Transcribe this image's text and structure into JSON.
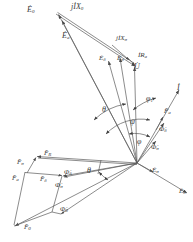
{
  "figure": {
    "type": "phasor-vector-diagram",
    "title": "",
    "stroke_color": "#555555",
    "label_color": "#3a3a3a",
    "background": "#ffffff",
    "width": 193,
    "height": 242
  },
  "origin": {
    "x": 137,
    "y": 163
  },
  "labels": {
    "e0": "Ė",
    "e0_sub": "0",
    "jix0": "jİX",
    "jix0_sub": "0",
    "ea": "Ė",
    "ea_sub": "a",
    "jixs": "jİX",
    "jixs_sub": "σ",
    "edelta": "Ė",
    "edelta_sub": "δ",
    "esigma": "Ė",
    "esigma_sub": "σ",
    "ira": "İR",
    "ira_sub": "a",
    "u": "U̇",
    "u_sub": "",
    "i": "İ",
    "i_sub": "",
    "fa_r": "F̄",
    "fa_r_sub": "a",
    "phi_d": "Φ̇",
    "phi_d_sub": "δ",
    "phi_s": "Φ̇",
    "phi_s_sub": "σ",
    "es_low": "Ė",
    "es_low_sub": "σ",
    "ed_low": "Ė",
    "ed_low_sub": "δ",
    "f_sigma": "F̄",
    "f_sigma_sub": "σ",
    "f_r": "F̄",
    "f_r_sub": "R",
    "f_a": "F̄",
    "f_a_sub": "a",
    "f_delta": "F̄",
    "f_delta_sub": "δ",
    "f_0": "F̄",
    "f_0_sub": "0",
    "phi_d2": "Φ̇",
    "phi_d2_sub": "δ",
    "phi_s2": "Φ̇",
    "phi_s2_sub": "σ",
    "phi_0": "Φ̇",
    "phi_0_sub": "0",
    "ang_theta": "θ",
    "ang_theta2": "θ",
    "ang_phi1": "φ",
    "ang_phi1_sub": "1",
    "ang_psi": "ψ",
    "ang_phi": "φ"
  },
  "vectors": [
    {
      "name": "E0",
      "from": [
        137,
        163
      ],
      "to": [
        57,
        13
      ],
      "label": "Ė0"
    },
    {
      "name": "jIX0",
      "from": [
        57,
        13
      ],
      "to": [
        137,
        163
      ],
      "label": "jİX0"
    },
    {
      "name": "Ea",
      "from": [
        137,
        163
      ],
      "to": [
        62,
        20
      ],
      "label": "Ėa"
    },
    {
      "name": "jIXsigma",
      "from": [
        118,
        50
      ],
      "to": [
        131,
        65
      ],
      "label": "jİXσ"
    },
    {
      "name": "Edelta",
      "from": [
        137,
        163
      ],
      "to": [
        108,
        60
      ],
      "label": "Ėδ"
    },
    {
      "name": "Esigma",
      "from": [
        137,
        163
      ],
      "to": [
        119,
        57
      ],
      "label": "Ėσ"
    },
    {
      "name": "IRa",
      "from": [
        128,
        62
      ],
      "to": [
        137,
        68
      ],
      "label": "İRa"
    },
    {
      "name": "U",
      "from": [
        137,
        163
      ],
      "to": [
        134,
        66
      ],
      "label": "U̇"
    },
    {
      "name": "I",
      "from": [
        137,
        163
      ],
      "to": [
        178,
        92
      ],
      "label": "İ"
    },
    {
      "name": "Fa_right",
      "from": [
        137,
        163
      ],
      "to": [
        170,
        107
      ],
      "label": "F̄a"
    },
    {
      "name": "Phi_delta",
      "from": [
        137,
        163
      ],
      "to": [
        163,
        125
      ],
      "label": "Φ̇δ"
    },
    {
      "name": "Phi_sigma",
      "from": [
        137,
        163
      ],
      "to": [
        155,
        143
      ],
      "label": "Φ̇σ"
    },
    {
      "name": "Esigma_lo",
      "from": [
        137,
        163
      ],
      "to": [
        152,
        172
      ],
      "label": "Ėσ"
    },
    {
      "name": "Edelta_lo",
      "from": [
        137,
        163
      ],
      "to": [
        186,
        192
      ],
      "label": "Ėδ"
    },
    {
      "name": "F_R",
      "from": [
        137,
        163
      ],
      "to": [
        36,
        156
      ],
      "label": "F̄R"
    },
    {
      "name": "F_sigma",
      "from": [
        36,
        156
      ],
      "to": [
        25,
        172
      ],
      "label": "F̄σ"
    },
    {
      "name": "F_a",
      "from": [
        25,
        172
      ],
      "to": [
        62,
        175
      ],
      "label": "F̄a"
    },
    {
      "name": "F_delta",
      "from": [
        137,
        163
      ],
      "to": [
        61,
        176
      ],
      "label": "F̄δ"
    },
    {
      "name": "F_0",
      "from": [
        137,
        163
      ],
      "to": [
        14,
        226
      ],
      "label": "F̄0"
    },
    {
      "name": "Phi_0",
      "from": [
        137,
        163
      ],
      "to": [
        60,
        214
      ],
      "label": "Φ̇0"
    },
    {
      "name": "Phi_delta2",
      "from": [
        137,
        163
      ],
      "to": [
        63,
        177
      ],
      "label": "Φ̇δ"
    }
  ],
  "angles": [
    {
      "name": "theta-upper",
      "label": "θ",
      "at": [
        104,
        112
      ]
    },
    {
      "name": "phi1",
      "label": "φ1",
      "at": [
        149,
        104
      ]
    },
    {
      "name": "psi",
      "label": "ψ",
      "at": [
        133,
        122
      ]
    },
    {
      "name": "phi",
      "label": "φ",
      "at": [
        140,
        143
      ]
    },
    {
      "name": "theta-lower",
      "label": "θ",
      "at": [
        91,
        172
      ]
    }
  ]
}
